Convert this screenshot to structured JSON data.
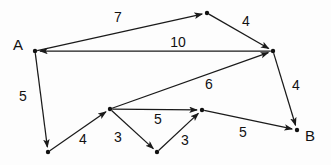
{
  "diagram": {
    "background_color": "#fdfdfd",
    "stroke_color": "#1a1a1a",
    "node_color": "#111111",
    "nodes": [
      {
        "id": "A",
        "label": "A",
        "x": 35,
        "y": 51,
        "label_x": 13,
        "label_y": 37,
        "show_label": true
      },
      {
        "id": "T",
        "label": "",
        "x": 207,
        "y": 13,
        "label_x": 0,
        "label_y": 0,
        "show_label": false
      },
      {
        "id": "R",
        "label": "",
        "x": 273,
        "y": 51,
        "label_x": 0,
        "label_y": 0,
        "show_label": false
      },
      {
        "id": "B",
        "label": "B",
        "x": 297,
        "y": 130,
        "label_x": 305,
        "label_y": 128,
        "show_label": true
      },
      {
        "id": "L",
        "label": "",
        "x": 48,
        "y": 152,
        "label_x": 0,
        "label_y": 0,
        "show_label": false
      },
      {
        "id": "M",
        "label": "",
        "x": 110,
        "y": 109,
        "label_x": 0,
        "label_y": 0,
        "show_label": false
      },
      {
        "id": "C",
        "label": "",
        "x": 157,
        "y": 152,
        "label_x": 0,
        "label_y": 0,
        "show_label": false
      },
      {
        "id": "N",
        "label": "",
        "x": 202,
        "y": 110,
        "label_x": 0,
        "label_y": 0,
        "show_label": false
      }
    ],
    "edges": [
      {
        "from": "A",
        "to": "T",
        "weight": "7",
        "label_x": 118,
        "label_y": 17
      },
      {
        "from": "T",
        "to": "R",
        "weight": "4",
        "label_x": 246,
        "label_y": 21
      },
      {
        "from": "R",
        "to": "A",
        "weight": "10",
        "label_x": 178,
        "label_y": 42
      },
      {
        "from": "A",
        "to": "L",
        "weight": "5",
        "label_x": 23,
        "label_y": 96
      },
      {
        "from": "M",
        "to": "R",
        "weight": "6",
        "label_x": 209,
        "label_y": 84
      },
      {
        "from": "R",
        "to": "B",
        "weight": "4",
        "label_x": 296,
        "label_y": 85
      },
      {
        "from": "L",
        "to": "M",
        "weight": "4",
        "label_x": 83,
        "label_y": 139
      },
      {
        "from": "M",
        "to": "C",
        "weight": "3",
        "label_x": 118,
        "label_y": 137
      },
      {
        "from": "M",
        "to": "N",
        "weight": "5",
        "label_x": 158,
        "label_y": 119
      },
      {
        "from": "C",
        "to": "N",
        "weight": "3",
        "label_x": 185,
        "label_y": 140
      },
      {
        "from": "N",
        "to": "B",
        "weight": "5",
        "label_x": 243,
        "label_y": 132
      }
    ]
  }
}
